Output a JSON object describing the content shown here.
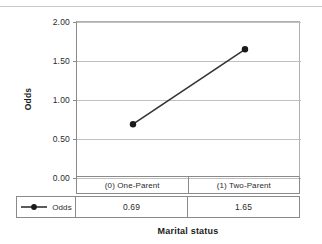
{
  "chart_data": {
    "type": "line",
    "title": "",
    "xlabel": "Marital status",
    "ylabel": "Odds",
    "categories": [
      "(0) One-Parent",
      "(1) Two-Parent"
    ],
    "series": [
      {
        "name": "Odds",
        "values": [
          0.69,
          1.65
        ],
        "value_labels": [
          "0.69",
          "1.65"
        ],
        "color": "#333333",
        "marker": "filled-circle"
      }
    ],
    "ylim": [
      0.0,
      2.0
    ],
    "yticks": [
      2.0,
      1.5,
      1.0,
      0.5,
      0.0
    ],
    "ytick_labels": [
      "2.00",
      "1.50",
      "1.00",
      "0.50",
      "0.00"
    ],
    "grid": true,
    "legend_position": "bottom-table",
    "data_table": {
      "row_header": "Odds",
      "columns": [
        "(0) One-Parent",
        "(1) Two-Parent"
      ],
      "values": [
        "0.69",
        "1.65"
      ]
    }
  },
  "axis": {
    "y_title": "Odds",
    "x_title": "Marital status"
  },
  "colors": {
    "series": "#333333",
    "gridline": "#c0c0c0",
    "axis": "#8a8a8a",
    "text": "#2b2b2b"
  }
}
